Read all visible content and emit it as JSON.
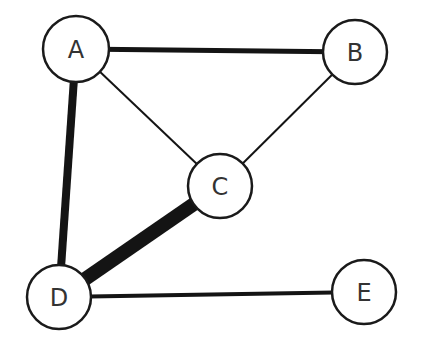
{
  "diagram": {
    "type": "weighted-undirected-graph",
    "colors": {
      "edge": "#141414",
      "node_stroke": "#1a1a1a",
      "node_fill": "#ffffff",
      "label": "#333333"
    },
    "nodes": [
      {
        "id": "A",
        "label": "A",
        "x": 76,
        "y": 49,
        "r": 33
      },
      {
        "id": "B",
        "label": "B",
        "x": 355,
        "y": 52,
        "r": 32
      },
      {
        "id": "C",
        "label": "C",
        "x": 220,
        "y": 186,
        "r": 32
      },
      {
        "id": "D",
        "label": "D",
        "x": 59,
        "y": 297,
        "r": 32
      },
      {
        "id": "E",
        "label": "E",
        "x": 364,
        "y": 292,
        "r": 32
      }
    ],
    "edges": [
      {
        "from": "A",
        "to": "B",
        "width": 5
      },
      {
        "from": "A",
        "to": "C",
        "width": 2
      },
      {
        "from": "B",
        "to": "C",
        "width": 2
      },
      {
        "from": "A",
        "to": "D",
        "width": 8
      },
      {
        "from": "C",
        "to": "D",
        "width": 14
      },
      {
        "from": "D",
        "to": "E",
        "width": 4
      }
    ]
  }
}
